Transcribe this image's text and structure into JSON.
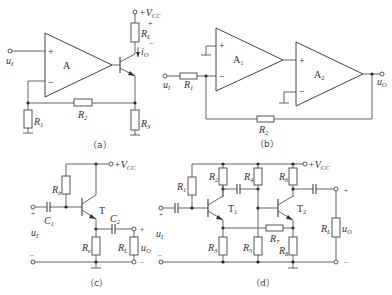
{
  "figure": {
    "panels": [
      {
        "id": "a",
        "caption": "（a）",
        "labels": {
          "input": "u",
          "input_sub": "I",
          "amp": "A",
          "vcc": "+V",
          "vcc_sub": "CC",
          "rl": "R",
          "rl_sub": "L",
          "io": "i",
          "io_sub": "O",
          "r1": "R",
          "r1_sub": "1",
          "r2": "R",
          "r2_sub": "2",
          "r3": "R",
          "r3_sub": "3",
          "plus": "+",
          "minus": "−"
        }
      },
      {
        "id": "b",
        "caption": "（b）",
        "labels": {
          "input": "u",
          "input_sub": "I",
          "output": "u",
          "output_sub": "O",
          "a1": "A",
          "a1_sub": "1",
          "a2": "A",
          "a2_sub": "2",
          "r1": "R",
          "r1_sub": "1",
          "r2": "R",
          "r2_sub": "2",
          "plus": "+",
          "minus": "−"
        }
      },
      {
        "id": "c",
        "caption": "（c）",
        "labels": {
          "vcc": "+V",
          "vcc_sub": "CC",
          "rb": "R",
          "rb_sub": "b",
          "c1": "C",
          "c1_sub": "1",
          "c2": "C",
          "c2_sub": "2",
          "t": "T",
          "input": "u",
          "input_sub": "I",
          "re": "R",
          "re_sub": "e",
          "rl": "R",
          "rl_sub": "L",
          "output": "u",
          "output_sub": "O",
          "plus": "+",
          "minus": "−"
        }
      },
      {
        "id": "d",
        "caption": "（d）",
        "labels": {
          "vcc": "+V",
          "vcc_sub": "CC",
          "r1": "R",
          "r1_sub": "1",
          "r2": "R",
          "r2_sub": "2",
          "r3": "R",
          "r3_sub": "3",
          "r4": "R",
          "r4_sub": "4",
          "r5": "R",
          "r5_sub": "5",
          "r6": "R",
          "r6_sub": "6",
          "r7": "R",
          "r7_sub": "7",
          "r8": "R",
          "r8_sub": "8",
          "t1": "T",
          "t1_sub": "1",
          "t2": "T",
          "t2_sub": "2",
          "input": "u",
          "input_sub": "I",
          "rl": "R",
          "rl_sub": "L",
          "output": "u",
          "output_sub": "O",
          "plus": "+",
          "minus": "−"
        }
      }
    ]
  }
}
